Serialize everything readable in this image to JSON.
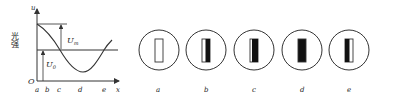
{
  "graph": {
    "y_axis_label": "u",
    "y_axis_title": "光强",
    "x_axis_label": "x",
    "origin_label": "O",
    "x_ticks": [
      "a",
      "b",
      "c",
      "d",
      "e"
    ],
    "annotations": {
      "um": "U",
      "um_sub": "m",
      "u0": "U",
      "u0_sub": "0"
    }
  },
  "patterns": [
    {
      "label": "a",
      "state": "outline-only"
    },
    {
      "label": "b",
      "state": "right-half-dark"
    },
    {
      "label": "c",
      "state": "mostly-dark"
    },
    {
      "label": "d",
      "state": "fully-dark"
    },
    {
      "label": "e",
      "state": "left-dark"
    }
  ],
  "colors": {
    "stroke": "#333333",
    "fill_dark": "#111111",
    "background": "#ffffff"
  }
}
